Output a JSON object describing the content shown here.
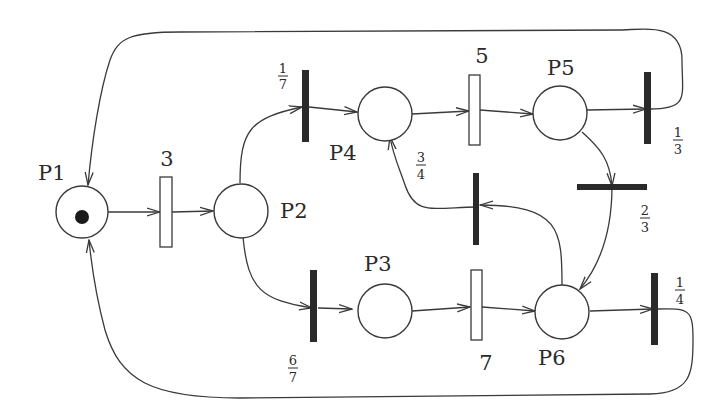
{
  "diagram": {
    "type": "Petri net (stochastic)",
    "places": [
      {
        "id": "P1",
        "label": "P1",
        "tokens": 1
      },
      {
        "id": "P2",
        "label": "P2",
        "tokens": 0
      },
      {
        "id": "P3",
        "label": "P3",
        "tokens": 0
      },
      {
        "id": "P4",
        "label": "P4",
        "tokens": 0
      },
      {
        "id": "P5",
        "label": "P5",
        "tokens": 0
      },
      {
        "id": "P6",
        "label": "P6",
        "tokens": 0
      }
    ],
    "timed_transitions": [
      {
        "id": "t3",
        "label": "3"
      },
      {
        "id": "t5",
        "label": "5"
      },
      {
        "id": "t7",
        "label": "7"
      }
    ],
    "immediate_transitions": [
      {
        "id": "t17",
        "weight_num": "1",
        "weight_den": "7"
      },
      {
        "id": "t67",
        "weight_num": "6",
        "weight_den": "7"
      },
      {
        "id": "t13",
        "weight_num": "1",
        "weight_den": "3"
      },
      {
        "id": "t23",
        "weight_num": "2",
        "weight_den": "3"
      },
      {
        "id": "t34",
        "weight_num": "3",
        "weight_den": "4"
      },
      {
        "id": "t14",
        "weight_num": "1",
        "weight_den": "4"
      }
    ],
    "arcs": [
      "P1->t3",
      "t3->P2",
      "P2->t17",
      "P2->t67",
      "t17->P4",
      "t67->P3",
      "P4->t5",
      "t5->P5",
      "P3->t7",
      "t7->P6",
      "P5->t13",
      "t13->P1",
      "P5->t23",
      "t23->P6",
      "P6->t34",
      "t34->P4",
      "P6->t14",
      "t14->P1"
    ]
  }
}
